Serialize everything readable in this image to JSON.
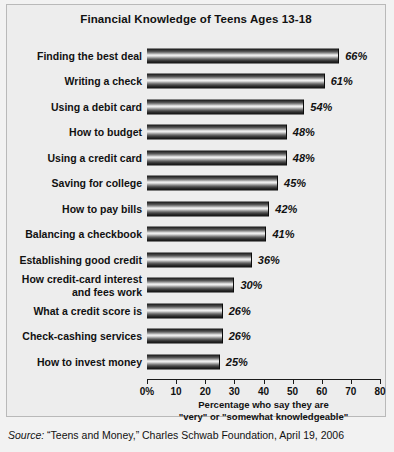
{
  "chart_data": {
    "type": "bar",
    "orientation": "horizontal",
    "title": "Financial Knowledge of Teens Ages 13-18",
    "xlabel": "Percentage who say they are\n\"very\" or \"somewhat knowledgeable\"",
    "ylabel": "",
    "xlim": [
      0,
      80
    ],
    "grid": false,
    "legend": false,
    "xticks": [
      0,
      10,
      20,
      30,
      40,
      50,
      60,
      70,
      80
    ],
    "xtick_labels": [
      "0%",
      "10",
      "20",
      "30",
      "40",
      "50",
      "60",
      "70",
      "80"
    ],
    "categories": [
      "Finding the best deal",
      "Writing a check",
      "Using a debit card",
      "How to budget",
      "Using a credit card",
      "Saving for college",
      "How to pay bills",
      "Balancing a checkbook",
      "Establishing good credit",
      "How credit-card interest\nand fees work",
      "What a credit score is",
      "Check-cashing services",
      "How to invest money"
    ],
    "values": [
      66,
      61,
      54,
      48,
      48,
      45,
      42,
      41,
      36,
      30,
      26,
      26,
      25
    ],
    "value_labels": [
      "66%",
      "61%",
      "54%",
      "48%",
      "48%",
      "45%",
      "42%",
      "41%",
      "36%",
      "30%",
      "26%",
      "26%",
      "25%"
    ]
  },
  "axis_title_lines": [
    "Percentage who say they are",
    "\"very\" or \"somewhat knowledgeable\""
  ],
  "source": {
    "label": "Source:",
    "text": " “Teens and Money,” Charles Schwab Foundation, April 19, 2006"
  },
  "colors": {
    "page_background": "#f2f2f2",
    "panel_background": "#ededed",
    "panel_border": "#b9b9b9",
    "bar_dark": "#111111",
    "bar_highlight": "#f0f0f0",
    "text": "#111111"
  }
}
